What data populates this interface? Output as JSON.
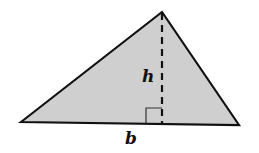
{
  "diagram": {
    "type": "triangle-area",
    "fill_color": "#cfcfcf",
    "stroke_color": "#111111",
    "vertices": {
      "left": [
        21,
        122
      ],
      "apex": [
        162,
        12
      ],
      "right": [
        239,
        125
      ]
    },
    "height_line": {
      "style": "dashed",
      "from": [
        162,
        12
      ],
      "to": [
        162,
        124
      ]
    },
    "right_angle_marker": true,
    "labels": {
      "height": "h",
      "base": "b"
    }
  }
}
